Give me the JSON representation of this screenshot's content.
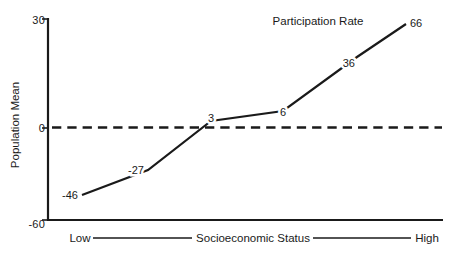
{
  "colors": {
    "ink": "#1a1a1a",
    "background": "#ffffff"
  },
  "chart_data": {
    "type": "line",
    "ylabel": "Population Mean",
    "xlabel": "Socioeconomic Status",
    "x_axis_endpoints": {
      "left": "Low",
      "right": "High"
    },
    "y_ticks": [
      {
        "value": 30,
        "label": "30"
      },
      {
        "value": 0,
        "label": "0"
      },
      {
        "value": -60,
        "label": "-60"
      }
    ],
    "ylim": [
      -60,
      30
    ],
    "grid": false,
    "legend": "none",
    "zero_reference_line": {
      "value": 0,
      "style": "dashed"
    },
    "series": [
      {
        "name": "Participation Rate",
        "x_ordinal": [
          1,
          2,
          3,
          4,
          5,
          6
        ],
        "values": [
          -46,
          -27,
          3,
          6,
          36,
          66
        ],
        "point_labels": [
          "-46",
          "-27",
          "3",
          "6",
          "36",
          "66"
        ]
      }
    ]
  }
}
